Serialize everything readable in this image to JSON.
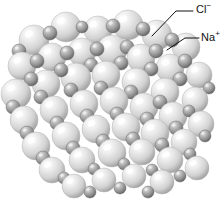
{
  "figure": {
    "kind": "space-filling-crystal-lattice",
    "background_color": "#ffffff",
    "width": 224,
    "height": 199
  },
  "labels": [
    {
      "id": "chloride",
      "symbol": "Cl",
      "charge": "−",
      "text": "Cl−",
      "color": "#111111",
      "leader": {
        "x1": 193,
        "y1": 11,
        "x2": 176,
        "y2": 11,
        "x3": 152,
        "y3": 36
      }
    },
    {
      "id": "sodium",
      "symbol": "Na",
      "charge": "+",
      "text": "Na+",
      "color": "#111111",
      "leader": {
        "x1": 199,
        "y1": 38,
        "x2": 185,
        "y2": 38,
        "x3": 167,
        "y3": 50
      }
    }
  ],
  "legend_note": "Large pale spheres are chloride ions; small dark spheres are sodium ions.",
  "ion_styles": {
    "chloride": {
      "role": "anion",
      "relative_size": "large",
      "base_color": "#d5d5d5",
      "highlight_color": "#fdfdfd",
      "shadow_color": "#8f8f8f",
      "radius_range_px": [
        11,
        16
      ]
    },
    "sodium": {
      "role": "cation",
      "relative_size": "small",
      "base_color": "#9a9a9a",
      "highlight_color": "#e2e2e2",
      "shadow_color": "#5b5b5b",
      "radius_range_px": [
        5,
        8
      ]
    }
  },
  "chart_data": {
    "type": "scatter",
    "xlabel": "",
    "ylabel": "",
    "xlim": [
      0,
      224
    ],
    "ylim": [
      0,
      199
    ],
    "grid": false,
    "legend": [
      "Cl−",
      "Na+"
    ],
    "legend_position": "top-right",
    "series": [
      {
        "name": "Cl−",
        "marker": "sphere-large",
        "points": [
          [
            34,
            40,
            15
          ],
          [
            66,
            27,
            15
          ],
          [
            98,
            30,
            14
          ],
          [
            128,
            25,
            15
          ],
          [
            157,
            35,
            15
          ],
          [
            186,
            47,
            14
          ],
          [
            22,
            66,
            14
          ],
          [
            52,
            57,
            14
          ],
          [
            82,
            52,
            14
          ],
          [
            112,
            50,
            15
          ],
          [
            141,
            58,
            14
          ],
          [
            170,
            68,
            14
          ],
          [
            199,
            75,
            13
          ],
          [
            16,
            94,
            15
          ],
          [
            46,
            84,
            14
          ],
          [
            76,
            78,
            15
          ],
          [
            106,
            75,
            14
          ],
          [
            136,
            82,
            14
          ],
          [
            165,
            92,
            14
          ],
          [
            195,
            100,
            13
          ],
          [
            24,
            120,
            14
          ],
          [
            54,
            110,
            14
          ],
          [
            84,
            104,
            14
          ],
          [
            114,
            101,
            14
          ],
          [
            144,
            107,
            14
          ],
          [
            173,
            116,
            14
          ],
          [
            201,
            124,
            13
          ],
          [
            36,
            146,
            14
          ],
          [
            66,
            136,
            14
          ],
          [
            96,
            129,
            14
          ],
          [
            126,
            127,
            14
          ],
          [
            155,
            133,
            14
          ],
          [
            184,
            142,
            13
          ],
          [
            52,
            170,
            13
          ],
          [
            82,
            160,
            13
          ],
          [
            112,
            153,
            14
          ],
          [
            142,
            152,
            13
          ],
          [
            170,
            160,
            13
          ],
          [
            197,
            168,
            12
          ],
          [
            74,
            186,
            12
          ],
          [
            104,
            180,
            12
          ],
          [
            134,
            176,
            12
          ],
          [
            162,
            182,
            12
          ]
        ]
      },
      {
        "name": "Na+",
        "marker": "sphere-small",
        "points": [
          [
            50,
            33,
            7
          ],
          [
            82,
            27,
            6
          ],
          [
            113,
            26,
            7
          ],
          [
            143,
            29,
            7
          ],
          [
            172,
            40,
            7
          ],
          [
            19,
            51,
            7
          ],
          [
            37,
            61,
            7
          ],
          [
            67,
            53,
            7
          ],
          [
            97,
            49,
            7
          ],
          [
            127,
            47,
            7
          ],
          [
            156,
            51,
            7
          ],
          [
            185,
            61,
            7
          ],
          [
            31,
            79,
            7
          ],
          [
            61,
            70,
            7
          ],
          [
            91,
            65,
            7
          ],
          [
            121,
            63,
            7
          ],
          [
            151,
            69,
            7
          ],
          [
            180,
            79,
            7
          ],
          [
            209,
            88,
            6
          ],
          [
            13,
            107,
            7
          ],
          [
            41,
            97,
            7
          ],
          [
            71,
            90,
            7
          ],
          [
            101,
            88,
            7
          ],
          [
            131,
            92,
            7
          ],
          [
            160,
            102,
            7
          ],
          [
            189,
            111,
            6
          ],
          [
            27,
            133,
            7
          ],
          [
            57,
            123,
            7
          ],
          [
            87,
            116,
            7
          ],
          [
            117,
            114,
            7
          ],
          [
            147,
            119,
            7
          ],
          [
            176,
            128,
            7
          ],
          [
            205,
            136,
            6
          ],
          [
            43,
            158,
            7
          ],
          [
            73,
            148,
            7
          ],
          [
            103,
            141,
            7
          ],
          [
            133,
            139,
            7
          ],
          [
            162,
            145,
            7
          ],
          [
            190,
            154,
            6
          ],
          [
            64,
            178,
            6
          ],
          [
            94,
            169,
            6
          ],
          [
            124,
            164,
            6
          ],
          [
            152,
            170,
            6
          ],
          [
            180,
            176,
            6
          ],
          [
            90,
            192,
            6
          ],
          [
            120,
            188,
            6
          ],
          [
            148,
            192,
            6
          ]
        ]
      }
    ]
  }
}
